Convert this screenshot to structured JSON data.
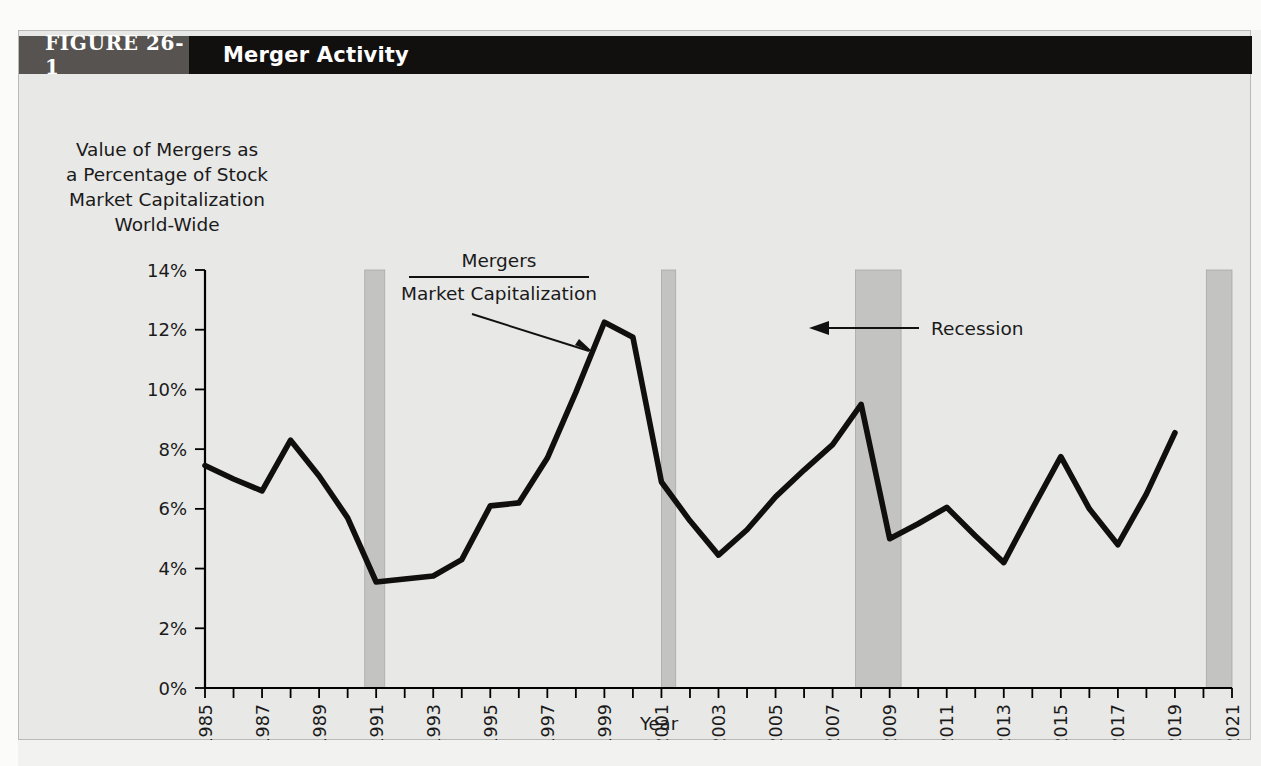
{
  "figure": {
    "number_label": "FIGURE 26-1",
    "title": "Merger Activity"
  },
  "axes": {
    "y_title_lines": [
      "Value of Mergers as",
      "a Percentage of Stock",
      "Market Capitalization",
      "World-Wide"
    ],
    "x_title": "Year"
  },
  "annotations": {
    "series_numerator": "Mergers",
    "series_denominator": "Market Capitalization",
    "recession": "Recession"
  },
  "chart_data": {
    "type": "line",
    "title": "Merger Activity",
    "xlabel": "Year",
    "ylabel": "Value of Mergers as a Percentage of Stock Market Capitalization World-Wide",
    "xlim": [
      1985,
      2021
    ],
    "ylim": [
      0,
      14
    ],
    "ytick_labels": [
      "0%",
      "2%",
      "4%",
      "6%",
      "8%",
      "10%",
      "12%",
      "14%"
    ],
    "ytick_values": [
      0,
      2,
      4,
      6,
      8,
      10,
      12,
      14
    ],
    "xtick_labels": [
      "1985",
      "1987",
      "1989",
      "1991",
      "1993",
      "1995",
      "1997",
      "1999",
      "2001",
      "2003",
      "2005",
      "2007",
      "2009",
      "2011",
      "2013",
      "2015",
      "2017",
      "2019",
      "2021"
    ],
    "xtick_values": [
      1985,
      1987,
      1989,
      1991,
      1993,
      1995,
      1997,
      1999,
      2001,
      2003,
      2005,
      2007,
      2009,
      2011,
      2013,
      2015,
      2017,
      2019,
      2021
    ],
    "grid": false,
    "legend": false,
    "line_color": "#100f0e",
    "recession_band_color": "#c3c3c1",
    "series": [
      {
        "name": "Mergers / Market Capitalization",
        "x": [
          1985,
          1986,
          1987,
          1988,
          1989,
          1990,
          1991,
          1992,
          1993,
          1994,
          1995,
          1996,
          1997,
          1998,
          1999,
          2000,
          2001,
          2002,
          2003,
          2004,
          2005,
          2006,
          2007,
          2008,
          2009,
          2010,
          2011,
          2012,
          2013,
          2014,
          2015,
          2016,
          2017,
          2018,
          2019
        ],
        "values": [
          7.45,
          7.0,
          6.6,
          8.3,
          7.1,
          5.7,
          3.55,
          3.65,
          3.75,
          4.3,
          6.1,
          6.2,
          7.7,
          9.9,
          12.25,
          11.75,
          6.9,
          5.6,
          4.45,
          5.3,
          6.4,
          7.3,
          8.15,
          9.5,
          5.0,
          5.5,
          6.05,
          5.1,
          4.2,
          6.0,
          7.75,
          6.0,
          4.8,
          6.5,
          8.55
        ]
      }
    ],
    "recession_bands": [
      {
        "start": 1990.6,
        "end": 1991.3,
        "label": "Recession"
      },
      {
        "start": 2001.0,
        "end": 2001.5,
        "label": "Recession"
      },
      {
        "start": 2007.8,
        "end": 2009.4,
        "label": "Recession"
      },
      {
        "start": 2020.1,
        "end": 2021.1,
        "label": "Recession"
      }
    ]
  }
}
